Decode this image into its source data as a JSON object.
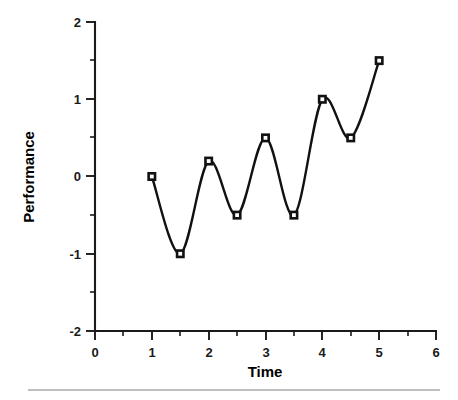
{
  "chart_data": {
    "type": "line",
    "title": "",
    "subtitle": "",
    "xlabel": "Time",
    "ylabel": "Performance",
    "xlim": [
      0,
      6
    ],
    "ylim": [
      -2,
      2
    ],
    "grid": false,
    "legend": false,
    "legend_position": "none",
    "x_major_ticks": [
      0,
      1,
      2,
      3,
      4,
      5,
      6
    ],
    "x_minor_ticks": [
      0.5,
      1.5,
      2.5,
      3.5,
      4.5,
      5.5
    ],
    "y_major_ticks": [
      -2,
      -1,
      0,
      1,
      2
    ],
    "y_minor_ticks": [
      -1.5,
      -0.5,
      0.5,
      1.5
    ],
    "x_tick_labels": [
      "0",
      "1",
      "2",
      "3",
      "4",
      "5",
      "6"
    ],
    "y_tick_labels": [
      "-2",
      "-1",
      "0",
      "1",
      "2"
    ],
    "marker_style": "open-square",
    "line_style": "smooth-spline",
    "series": [
      {
        "name": "Performance",
        "color": "#111111",
        "x": [
          1,
          1.5,
          2,
          2.5,
          3,
          3.5,
          4,
          4.5,
          5
        ],
        "values": [
          0,
          -1,
          0.2,
          -0.5,
          0.5,
          -0.5,
          1,
          0.5,
          1.5
        ]
      }
    ]
  },
  "figure": {
    "axis_color": "#1a1a1a",
    "background": "#ffffff",
    "footer_rule_color": "#a8a8a8"
  }
}
